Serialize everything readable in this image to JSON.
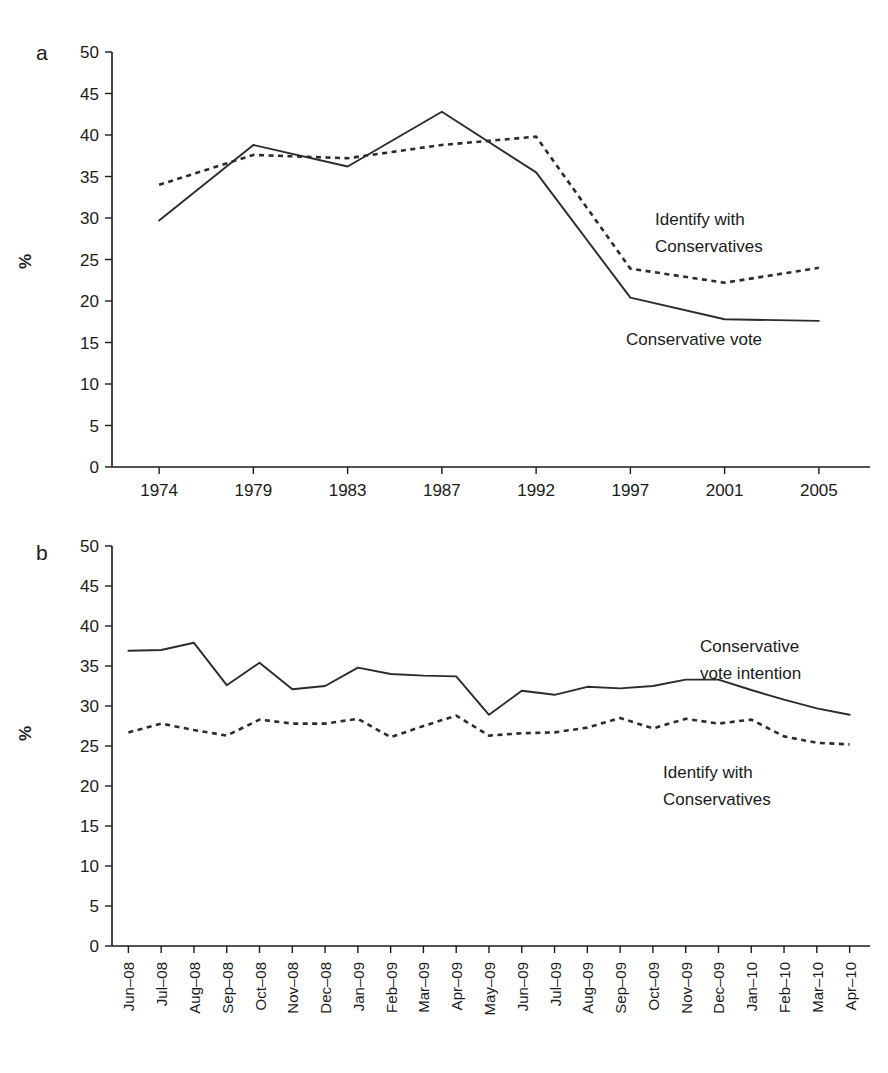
{
  "figure": {
    "background_color": "#ffffff",
    "line_color": "#2b2b2b"
  },
  "panel_a": {
    "letter": "a",
    "ylabel": "%",
    "annotation_identify": "Identify with",
    "annotation_identify_2": "Conservatives",
    "annotation_vote": "Conservative vote"
  },
  "panel_b": {
    "letter": "b",
    "ylabel": "%",
    "annotation_vote": "Conservative",
    "annotation_vote_2": "vote intention",
    "annotation_identify": "Identify with",
    "annotation_identify_2": "Conservatives"
  },
  "chart_data": [
    {
      "type": "line",
      "panel": "a",
      "title": "",
      "xlabel": "",
      "ylabel": "%",
      "ylim": [
        0,
        50
      ],
      "yticks": [
        0,
        5,
        10,
        15,
        20,
        25,
        30,
        35,
        40,
        45,
        50
      ],
      "grid": false,
      "legend": "inline annotations",
      "categories": [
        "1974",
        "1979",
        "1983",
        "1987",
        "1992",
        "1997",
        "2001",
        "2005"
      ],
      "series": [
        {
          "name": "Conservative vote",
          "style": "solid",
          "values": [
            29.7,
            38.8,
            36.2,
            42.8,
            35.5,
            20.4,
            17.8,
            17.6
          ]
        },
        {
          "name": "Identify with Conservatives",
          "style": "dotted",
          "values": [
            34.0,
            37.6,
            37.2,
            38.8,
            39.8,
            23.9,
            22.2,
            24.0
          ]
        }
      ]
    },
    {
      "type": "line",
      "panel": "b",
      "title": "",
      "xlabel": "",
      "ylabel": "%",
      "ylim": [
        0,
        50
      ],
      "yticks": [
        0,
        5,
        10,
        15,
        20,
        25,
        30,
        35,
        40,
        45,
        50
      ],
      "grid": false,
      "legend": "inline annotations",
      "categories": [
        "Jun–08",
        "Jul–08",
        "Aug–08",
        "Sep–08",
        "Oct–08",
        "Nov–08",
        "Dec–08",
        "Jan–09",
        "Feb–09",
        "Mar–09",
        "Apr–09",
        "May–09",
        "Jun–09",
        "Jul–09",
        "Aug–09",
        "Sep–09",
        "Oct–09",
        "Nov–09",
        "Dec–09",
        "Jan–10",
        "Feb–10",
        "Mar–10",
        "Apr–10"
      ],
      "series": [
        {
          "name": "Conservative vote intention",
          "style": "solid",
          "values": [
            36.9,
            37.0,
            37.9,
            32.6,
            35.4,
            32.1,
            32.5,
            34.8,
            34.0,
            33.8,
            33.7,
            28.9,
            31.9,
            31.4,
            32.4,
            32.2,
            32.5,
            33.3,
            33.3,
            32.0,
            30.8,
            29.7,
            28.9
          ]
        },
        {
          "name": "Identify with Conservatives",
          "style": "dotted",
          "values": [
            26.7,
            27.8,
            27.0,
            26.3,
            28.3,
            27.8,
            27.8,
            28.4,
            26.1,
            27.5,
            28.8,
            26.3,
            26.6,
            26.7,
            27.3,
            28.5,
            27.2,
            28.4,
            27.8,
            28.3,
            26.2,
            25.4,
            25.2
          ]
        }
      ]
    }
  ]
}
